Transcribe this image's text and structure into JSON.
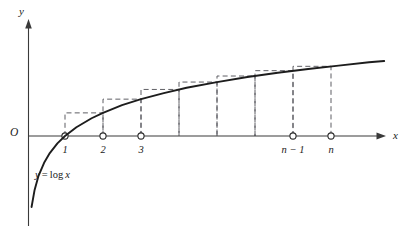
{
  "figure": {
    "background_color": "#ffffff",
    "curve_color": "#1d1d1d",
    "axis_color": "#3a3a3a",
    "rect_color": "#55555c"
  },
  "axes": {
    "y_axis_label": "y",
    "x_axis_label": "x",
    "origin_label": "O"
  },
  "curve": {
    "equation_label": "y = log x",
    "equation_lhs": "y",
    "equation_eq": "=",
    "equation_fn": "log",
    "equation_arg": "x"
  },
  "ticks": [
    {
      "label": "1",
      "show_label": true
    },
    {
      "label": "2",
      "show_label": true
    },
    {
      "label": "3",
      "show_label": true
    },
    {
      "label": "n − 1",
      "show_label": true
    },
    {
      "label": "n",
      "show_label": true
    }
  ],
  "chart_data": {
    "type": "line",
    "xlabel": "x",
    "ylabel": "y",
    "legend": [],
    "grid": false,
    "xlim": [
      0,
      9.6
    ],
    "ylim": [
      -2.4,
      2.6
    ],
    "series": [
      {
        "name": "y = log x",
        "x": [
          0.12,
          0.2,
          0.3,
          0.45,
          0.6,
          0.8,
          1.0,
          1.3,
          1.7,
          2.0,
          2.5,
          3.0,
          3.6,
          4.2,
          5.0,
          5.8,
          6.6,
          7.4,
          8.2,
          9.0,
          9.4
        ],
        "y": [
          -2.12,
          -1.61,
          -1.2,
          -0.8,
          -0.51,
          -0.22,
          0.0,
          0.26,
          0.53,
          0.69,
          0.92,
          1.1,
          1.28,
          1.44,
          1.61,
          1.76,
          1.89,
          2.0,
          2.1,
          2.2,
          2.24
        ]
      }
    ],
    "rectangles": {
      "kind": "circumscribed",
      "note": "Each rectangle has height log(right endpoint) over interval [k, k+1]",
      "intervals": [
        {
          "x_left": 1,
          "x_right": 2,
          "height": 0.69
        },
        {
          "x_left": 2,
          "x_right": 3,
          "height": 1.1
        },
        {
          "x_left": 3,
          "x_right": 4,
          "height": 1.39
        },
        {
          "x_left": 4,
          "x_right": 5,
          "height": 1.61
        },
        {
          "x_left": 5,
          "x_right": 6,
          "height": 1.79
        },
        {
          "x_left": 6,
          "x_right": 7,
          "height": 1.95
        },
        {
          "x_left": 7,
          "x_right": 8,
          "height": 2.08
        }
      ]
    },
    "tick_points": [
      {
        "x": 1,
        "label": "1"
      },
      {
        "x": 2,
        "label": "2"
      },
      {
        "x": 3,
        "label": "3"
      },
      {
        "x": 4,
        "label": ""
      },
      {
        "x": 5,
        "label": ""
      },
      {
        "x": 6,
        "label": ""
      },
      {
        "x": 7,
        "label": "n − 1"
      },
      {
        "x": 8,
        "label": "n"
      }
    ]
  }
}
